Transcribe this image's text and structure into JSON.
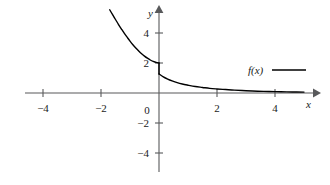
{
  "chart_data": {
    "type": "line",
    "title": "",
    "xlabel": "x",
    "ylabel": "y",
    "xlim": [
      -5.1,
      5.3
    ],
    "ylim": [
      -5.7,
      5.7
    ],
    "grid": false,
    "axes_style": "arrowed-cross-axes",
    "xticks": [
      -4,
      -2,
      0,
      2,
      4
    ],
    "xtick_labels": [
      "-4",
      "-2",
      "0",
      "2",
      "4"
    ],
    "yticks": [
      4,
      2,
      -2,
      -4
    ],
    "ytick_labels": [
      "4",
      "2",
      "-2",
      "-4"
    ],
    "legend": {
      "position": "upper right",
      "entries": [
        {
          "name": "f(x)",
          "marker": "line",
          "color": "#000000"
        }
      ]
    },
    "annotations": [
      {
        "text": "jump discontinuity at x = 0",
        "x": 0,
        "y_left_limit": 2.0,
        "y_right_limit": 1.27
      }
    ],
    "series": [
      {
        "name": "f(x) left branch",
        "color": "#000000",
        "linewidth": 1.4,
        "x": [
          -1.7,
          -1.6,
          -1.5,
          -1.4,
          -1.3,
          -1.2,
          -1.1,
          -1.0,
          -0.9,
          -0.8,
          -0.7,
          -0.6,
          -0.5,
          -0.4,
          -0.3,
          -0.2,
          -0.1,
          0.0
        ],
        "y": [
          5.55,
          5.22,
          4.9,
          4.58,
          4.28,
          3.99,
          3.72,
          3.46,
          3.22,
          3.0,
          2.8,
          2.62,
          2.46,
          2.32,
          2.2,
          2.11,
          2.04,
          2.0
        ]
      },
      {
        "name": "f(x) jump segment",
        "color": "#000000",
        "linewidth": 1.4,
        "x": [
          0.0,
          0.0
        ],
        "y": [
          2.0,
          1.27
        ]
      },
      {
        "name": "f(x) right branch",
        "color": "#000000",
        "linewidth": 1.4,
        "x": [
          0.0,
          0.15,
          0.3,
          0.45,
          0.6,
          0.8,
          1.0,
          1.25,
          1.5,
          1.75,
          2.0,
          2.3,
          2.6,
          3.0,
          3.4,
          3.8,
          4.2,
          4.6,
          5.0
        ],
        "y": [
          1.27,
          1.08,
          0.93,
          0.81,
          0.71,
          0.6,
          0.52,
          0.43,
          0.37,
          0.31,
          0.27,
          0.23,
          0.19,
          0.15,
          0.12,
          0.1,
          0.08,
          0.07,
          0.06
        ]
      }
    ]
  },
  "colors": {
    "curve": "#000000",
    "axis": "#58595b",
    "text": "#1a1a1a",
    "background": "#ffffff"
  },
  "geometry": {
    "origin_x": 159,
    "origin_y": 93,
    "x_unit_px": 29,
    "y_unit_px": 15,
    "x_axis_left_px": 25,
    "x_axis_right_px": 315,
    "y_axis_top_px": 7,
    "y_axis_bottom_px": 172,
    "legend_text_x_px": 248,
    "legend_text_y_px": 70,
    "legend_line_x1_px": 272,
    "legend_line_x2_px": 306,
    "legend_line_y_px": 70,
    "zero_label_x_px": 147,
    "zero_label_y_px": 105,
    "x_name_x_px": 306,
    "x_name_y_px": 99,
    "y_name_x_px": 148,
    "y_name_y_px": 8
  }
}
